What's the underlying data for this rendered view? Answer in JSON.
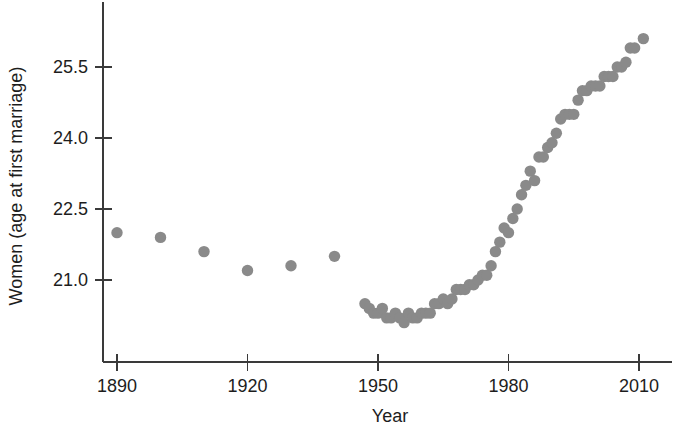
{
  "chart_data": {
    "type": "scatter",
    "title": "",
    "xlabel": "Year",
    "ylabel": "Women (age at first marriage)",
    "xlim": [
      1884,
      2016
    ],
    "ylim": [
      20.2,
      26.3
    ],
    "grid": false,
    "legend": "none",
    "marker": {
      "shape": "circle",
      "color": "#8a8a8a",
      "size": 9
    },
    "xticks": [
      1890,
      1920,
      1950,
      1980,
      2010
    ],
    "xticklabels": [
      "1890",
      "1920",
      "1950",
      "1980",
      "2010"
    ],
    "yticks": [
      21.0,
      22.5,
      24.0,
      25.5
    ],
    "yticklabels": [
      "21.0",
      "22.5",
      "24.0",
      "25.5"
    ],
    "series": [
      {
        "name": "Women age at first marriage",
        "points": [
          [
            1890,
            22.0
          ],
          [
            1900,
            21.9
          ],
          [
            1910,
            21.6
          ],
          [
            1920,
            21.2
          ],
          [
            1930,
            21.3
          ],
          [
            1940,
            21.5
          ],
          [
            1947,
            20.5
          ],
          [
            1948,
            20.4
          ],
          [
            1949,
            20.3
          ],
          [
            1950,
            20.3
          ],
          [
            1951,
            20.4
          ],
          [
            1952,
            20.2
          ],
          [
            1953,
            20.2
          ],
          [
            1954,
            20.3
          ],
          [
            1955,
            20.2
          ],
          [
            1956,
            20.1
          ],
          [
            1957,
            20.3
          ],
          [
            1958,
            20.2
          ],
          [
            1959,
            20.2
          ],
          [
            1960,
            20.3
          ],
          [
            1961,
            20.3
          ],
          [
            1962,
            20.3
          ],
          [
            1963,
            20.5
          ],
          [
            1964,
            20.5
          ],
          [
            1965,
            20.6
          ],
          [
            1966,
            20.5
          ],
          [
            1967,
            20.6
          ],
          [
            1968,
            20.8
          ],
          [
            1969,
            20.8
          ],
          [
            1970,
            20.8
          ],
          [
            1971,
            20.9
          ],
          [
            1972,
            20.9
          ],
          [
            1973,
            21.0
          ],
          [
            1974,
            21.1
          ],
          [
            1975,
            21.1
          ],
          [
            1976,
            21.3
          ],
          [
            1977,
            21.6
          ],
          [
            1978,
            21.8
          ],
          [
            1979,
            22.1
          ],
          [
            1980,
            22.0
          ],
          [
            1981,
            22.3
          ],
          [
            1982,
            22.5
          ],
          [
            1983,
            22.8
          ],
          [
            1984,
            23.0
          ],
          [
            1985,
            23.3
          ],
          [
            1986,
            23.1
          ],
          [
            1987,
            23.6
          ],
          [
            1988,
            23.6
          ],
          [
            1989,
            23.8
          ],
          [
            1990,
            23.9
          ],
          [
            1991,
            24.1
          ],
          [
            1992,
            24.4
          ],
          [
            1993,
            24.5
          ],
          [
            1994,
            24.5
          ],
          [
            1995,
            24.5
          ],
          [
            1996,
            24.8
          ],
          [
            1997,
            25.0
          ],
          [
            1998,
            25.0
          ],
          [
            1999,
            25.1
          ],
          [
            2000,
            25.1
          ],
          [
            2001,
            25.1
          ],
          [
            2002,
            25.3
          ],
          [
            2003,
            25.3
          ],
          [
            2004,
            25.3
          ],
          [
            2005,
            25.5
          ],
          [
            2006,
            25.5
          ],
          [
            2007,
            25.6
          ],
          [
            2008,
            25.9
          ],
          [
            2009,
            25.9
          ],
          [
            2011,
            26.1
          ]
        ]
      }
    ]
  },
  "axes": {
    "x_title": "Year",
    "y_title": "Women (age at first marriage)"
  }
}
